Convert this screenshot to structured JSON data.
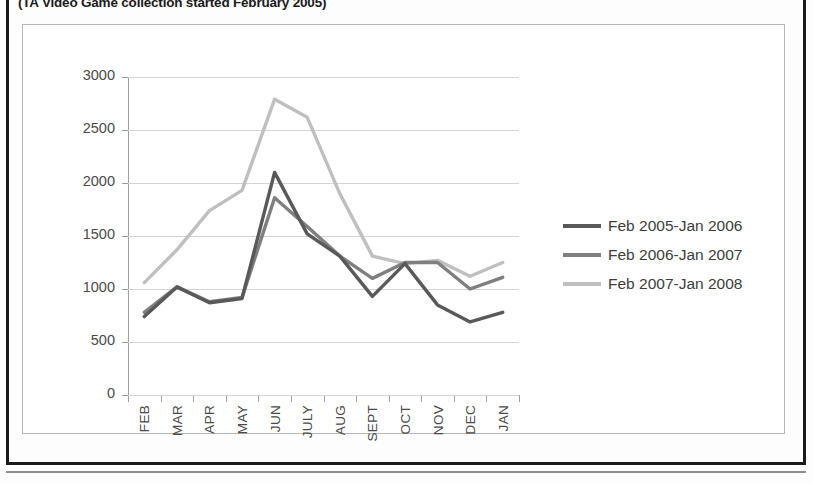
{
  "caption": "(TA Video Game collection started February 2005)",
  "legend": {
    "items": [
      {
        "label": "Feb 2005-Jan 2006",
        "color": "#595959"
      },
      {
        "label": "Feb 2006-Jan 2007",
        "color": "#7f7f7f"
      },
      {
        "label": "Feb 2007-Jan 2008",
        "color": "#bfbfbf"
      }
    ]
  },
  "chart_data": {
    "type": "line",
    "title": "(TA Video Game collection started February 2005)",
    "xlabel": "",
    "ylabel": "",
    "ylim": [
      0,
      3000
    ],
    "yticks": [
      0,
      500,
      1000,
      1500,
      2000,
      2500,
      3000
    ],
    "ytick_labels": [
      "0",
      "500",
      "1000",
      "1500",
      "2000",
      "2500",
      "3000"
    ],
    "grid": true,
    "legend_position": "right",
    "categories": [
      "FEB",
      "MAR",
      "APR",
      "MAY",
      "JUN",
      "JULY",
      "AUG",
      "SEPT",
      "OCT",
      "NOV",
      "DEC",
      "JAN"
    ],
    "series": [
      {
        "name": "Feb 2005-Jan 2006",
        "color": "#595959",
        "values": [
          740,
          1020,
          870,
          910,
          2100,
          1520,
          1310,
          930,
          1240,
          850,
          690,
          780
        ]
      },
      {
        "name": "Feb 2006-Jan 2007",
        "color": "#7f7f7f",
        "values": [
          780,
          1020,
          880,
          920,
          1860,
          1590,
          1310,
          1100,
          1250,
          1250,
          1000,
          1110
        ]
      },
      {
        "name": "Feb 2007-Jan 2008",
        "color": "#bfbfbf",
        "values": [
          1060,
          1370,
          1740,
          1930,
          2790,
          2620,
          1900,
          1310,
          1240,
          1270,
          1120,
          1250
        ]
      }
    ]
  }
}
